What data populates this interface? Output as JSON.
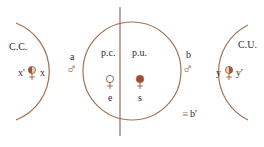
{
  "colors": {
    "line": "#a07252",
    "symbol": "#9c5a3c",
    "text": "#2a2a2a"
  },
  "regions": {
    "left": {
      "label": "C.C.",
      "left_var": "x'",
      "right_var": "x",
      "symbol": "half-filled-female-left"
    },
    "middle": {
      "left_half": {
        "label": "p.c.",
        "symbol": "hollow-female",
        "sub": "e"
      },
      "right_half": {
        "label": "p.u.",
        "symbol": "filled-female",
        "sub": "s"
      }
    },
    "right": {
      "label": "C.U.",
      "left_var": "y",
      "right_var": "y'",
      "symbol": "half-filled-female-right"
    }
  },
  "connectors": {
    "a": {
      "label": "a",
      "symbol": "♂"
    },
    "b": {
      "label": "b",
      "symbol": "♂",
      "note": "b'"
    }
  },
  "glyphs": {
    "male": "♂",
    "triple_bar": "≡"
  }
}
